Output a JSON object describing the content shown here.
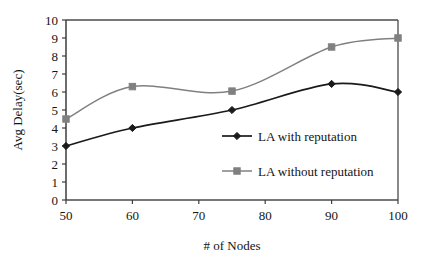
{
  "chart_data": {
    "type": "line",
    "title": "",
    "xlabel": "# of Nodes",
    "ylabel": "Avg Delay(sec)",
    "x": [
      50,
      60,
      75,
      90,
      100
    ],
    "xlim": [
      50,
      100
    ],
    "ylim": [
      0,
      10
    ],
    "xticks": [
      "50",
      "60",
      "70",
      "80",
      "90",
      "100"
    ],
    "xtick_values": [
      50,
      60,
      70,
      80,
      90,
      100
    ],
    "yticks": [
      "0",
      "1",
      "2",
      "3",
      "4",
      "5",
      "6",
      "7",
      "8",
      "9",
      "10"
    ],
    "ytick_values": [
      0,
      1,
      2,
      3,
      4,
      5,
      6,
      7,
      8,
      9,
      10
    ],
    "grid": false,
    "smooth": true,
    "legend_position": "center-right-inside",
    "series": [
      {
        "name": "LA with reputation",
        "values": [
          3.0,
          4.0,
          5.0,
          6.45,
          6.0
        ],
        "color": "#1a1a1a",
        "marker": "diamond"
      },
      {
        "name": "LA without reputation",
        "values": [
          4.5,
          6.3,
          6.05,
          8.5,
          9.0
        ],
        "color": "#808080",
        "marker": "square"
      }
    ]
  },
  "axes": {
    "x_title": "# of Nodes",
    "y_title": "Avg Delay(sec)",
    "xtick_labels": [
      "50",
      "60",
      "70",
      "80",
      "90",
      "100"
    ],
    "ytick_labels": [
      "0",
      "1",
      "2",
      "3",
      "4",
      "5",
      "6",
      "7",
      "8",
      "9",
      "10"
    ]
  },
  "legend": {
    "entries": [
      {
        "label": "LA with reputation",
        "color": "#1a1a1a",
        "marker": "diamond"
      },
      {
        "label": "LA without reputation",
        "color": "#808080",
        "marker": "square"
      }
    ]
  },
  "colors": {
    "series_with_reputation": "#1a1a1a",
    "series_without_reputation": "#808080",
    "axis": "#3d3d3d",
    "background": "#ffffff",
    "text": "#141414"
  }
}
